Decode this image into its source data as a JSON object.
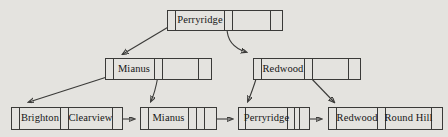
{
  "figure": {
    "background_color": "#e4e3df",
    "line_color": "#3a3a38",
    "text_color": "#161616"
  },
  "nodes": {
    "root": {
      "keys": [
        "Perryridge",
        ""
      ]
    },
    "internal_left": {
      "keys": [
        "Mianus",
        ""
      ]
    },
    "internal_right": {
      "keys": [
        "Redwood",
        ""
      ]
    },
    "leaf_1": {
      "keys": [
        "Brighton",
        "Clearview"
      ]
    },
    "leaf_2": {
      "keys": [
        "Mianus",
        ""
      ]
    },
    "leaf_3": {
      "keys": [
        "Perryridge",
        ""
      ]
    },
    "leaf_4": {
      "keys": [
        "Redwood",
        "Round Hill"
      ]
    }
  }
}
